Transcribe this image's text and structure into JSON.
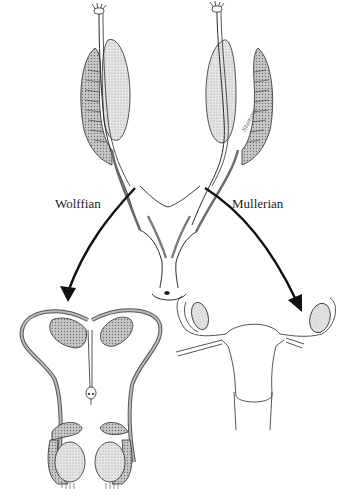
{
  "figure": {
    "labels": {
      "left": "Wolffian",
      "right": "Mullerian"
    },
    "signature": "Stamper",
    "panels": [
      {
        "name": "indifferent-stage",
        "position": "top-center",
        "description": "Paired gonads with Wolffian and Mullerian ducts joining at urogenital sinus"
      },
      {
        "name": "male-derivatives",
        "position": "bottom-left",
        "description": "Testes, epididymis, vas deferens, seminal vesicles"
      },
      {
        "name": "female-derivatives",
        "position": "bottom-right",
        "description": "Ovaries, uterine tubes, uterus, upper vagina"
      }
    ],
    "colors": {
      "line": "#2a2a2a",
      "shade": "#b8b8b8",
      "light_shade": "#d8d8d8",
      "arrow": "#111111"
    }
  }
}
